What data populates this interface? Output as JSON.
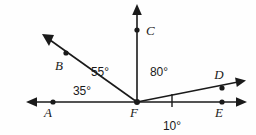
{
  "figure": {
    "background_color": "#fefefe",
    "stroke_color": "#1a1a1a"
  },
  "points": [
    {
      "id": "A",
      "label": "A",
      "x": 53,
      "y": 102,
      "label_x": 48,
      "label_y": 117
    },
    {
      "id": "B",
      "label": "B",
      "x": 66,
      "y": 53,
      "label_x": 59,
      "label_y": 70
    },
    {
      "id": "C",
      "label": "C",
      "x": 137,
      "y": 30,
      "label_x": 144,
      "label_y": 35
    },
    {
      "id": "D",
      "label": "D",
      "x": 222,
      "y": 88,
      "label_x": 217,
      "label_y": 79
    },
    {
      "id": "E",
      "label": "E",
      "x": 222,
      "y": 102,
      "label_x": 217,
      "label_y": 117
    },
    {
      "id": "F",
      "label": "F",
      "x": 137,
      "y": 102,
      "label_x": 132,
      "label_y": 117
    }
  ],
  "rays": [
    {
      "id": "FB",
      "from": "F",
      "through": "B",
      "tip_x": 44,
      "tip_y": 36,
      "arrow": true
    },
    {
      "id": "FC",
      "from": "F",
      "through": "C",
      "tip_x": 137,
      "tip_y": 6,
      "arrow": true
    },
    {
      "id": "FD",
      "from": "F",
      "through": "D",
      "tip_x": 245,
      "tip_y": 80,
      "arrow": true
    },
    {
      "id": "FE",
      "from": "F",
      "through": "E",
      "tip_x": 245,
      "tip_y": 102,
      "arrow": true
    },
    {
      "id": "FA",
      "from": "F",
      "through": "A",
      "tip_x": 28,
      "tip_y": 102,
      "arrow": true
    }
  ],
  "angles": [
    {
      "id": "angle-BFC",
      "value": "55°",
      "label_x": 100,
      "label_y": 76,
      "between": [
        "B",
        "C"
      ]
    },
    {
      "id": "angle-AFB",
      "value": "35°",
      "label_x": 82,
      "label_y": 95,
      "between": [
        "A",
        "B"
      ]
    },
    {
      "id": "angle-CFD",
      "value": "80°",
      "label_x": 146,
      "label_y": 76,
      "between": [
        "C",
        "D"
      ]
    },
    {
      "id": "angle-DFE",
      "value": "10°",
      "label_x": 163,
      "label_y": 129,
      "between": [
        "D",
        "E"
      ]
    }
  ],
  "tick": {
    "id": "angle-tick-10",
    "x": 172,
    "y_top": 94,
    "y_bottom": 107
  }
}
